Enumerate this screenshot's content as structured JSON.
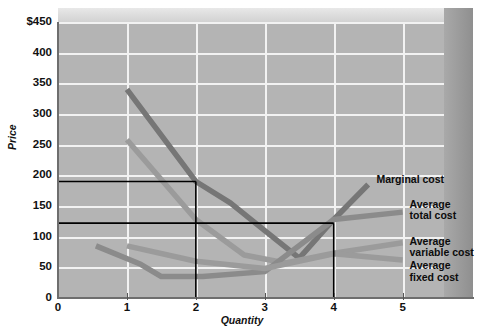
{
  "chart_data": {
    "type": "line",
    "title": "",
    "xlabel": "Quantity",
    "ylabel": "Price",
    "xlim": [
      0,
      5.6
    ],
    "ylim": [
      0,
      450
    ],
    "grid": true,
    "legend_position": "right-inside",
    "x_ticks": [
      "0",
      "1",
      "2",
      "3",
      "4",
      "5"
    ],
    "y_ticks": [
      "0",
      "50",
      "100",
      "150",
      "200",
      "250",
      "300",
      "350",
      "400",
      "$450"
    ],
    "series": [
      {
        "name": "Marginal cost",
        "color": "#767676",
        "points": [
          [
            1,
            340
          ],
          [
            2,
            190
          ],
          [
            2.5,
            155
          ],
          [
            3,
            110
          ],
          [
            3.5,
            65
          ],
          [
            4,
            128
          ],
          [
            4.5,
            185
          ]
        ]
      },
      {
        "name": "Average total cost",
        "color": "#9b9b9b",
        "points": [
          [
            1,
            258
          ],
          [
            2,
            128
          ],
          [
            2.7,
            70
          ],
          [
            3.3,
            57
          ],
          [
            4,
            73
          ],
          [
            5,
            90
          ]
        ]
      },
      {
        "name": "Average variable cost",
        "color": "#8b8b8b",
        "points": [
          [
            0.55,
            85
          ],
          [
            1.2,
            55
          ],
          [
            1.5,
            35
          ],
          [
            2.1,
            35
          ],
          [
            3,
            43
          ],
          [
            4,
            128
          ],
          [
            5,
            140
          ]
        ]
      },
      {
        "name": "Average fixed cost",
        "color": "#9b9b9b",
        "points": [
          [
            1,
            85
          ],
          [
            2,
            60
          ],
          [
            3,
            48
          ],
          [
            4,
            72
          ],
          [
            5,
            62
          ]
        ]
      }
    ],
    "reference_lines": [
      {
        "name": "upper-price-line",
        "type": "horizontal",
        "value": 190,
        "x_from": 0,
        "x_to": 2
      },
      {
        "name": "upper-quantity-line",
        "type": "vertical",
        "value": 2,
        "y_from": 0,
        "y_to": 190
      },
      {
        "name": "lower-price-line",
        "type": "horizontal",
        "value": 122,
        "x_from": 0,
        "x_to": 4
      },
      {
        "name": "lower-quantity-line",
        "type": "vertical",
        "value": 4,
        "y_from": 0,
        "y_to": 122
      }
    ],
    "annotations": [
      {
        "name": "marginal-cost-label",
        "text": "Marginal cost",
        "x": 4.62,
        "y": 192
      },
      {
        "name": "average-total-cost-label",
        "text": "Average\ntotal cost",
        "x": 5.1,
        "y": 152
      },
      {
        "name": "average-variable-cost-label",
        "text": "Average\nvariable cost",
        "x": 5.1,
        "y": 92
      },
      {
        "name": "average-fixed-cost-label",
        "text": "Average\nfixed cost",
        "x": 5.1,
        "y": 52
      }
    ]
  },
  "axes": {
    "y_title": "Price",
    "x_title": "Quantity",
    "y_labels": [
      "$450",
      "400",
      "350",
      "300",
      "250",
      "200",
      "150",
      "100",
      "50",
      "0"
    ],
    "x_labels": [
      "0",
      "1",
      "2",
      "3",
      "4",
      "5"
    ]
  },
  "legend": {
    "marginal_cost": "Marginal cost",
    "average_total_cost": "Average\ntotal cost",
    "average_variable_cost": "Average\nvariable cost",
    "average_fixed_cost": "Average\nfixed cost"
  },
  "colors": {
    "plot_background": "#b4b4b4",
    "gridline": "#f2f2f2",
    "bevel_top": "#dcdcdc",
    "bevel_right": "#9a9a9a",
    "reference_line": "#000000",
    "dark_curve": "#767676",
    "light_curve": "#9b9b9b"
  }
}
